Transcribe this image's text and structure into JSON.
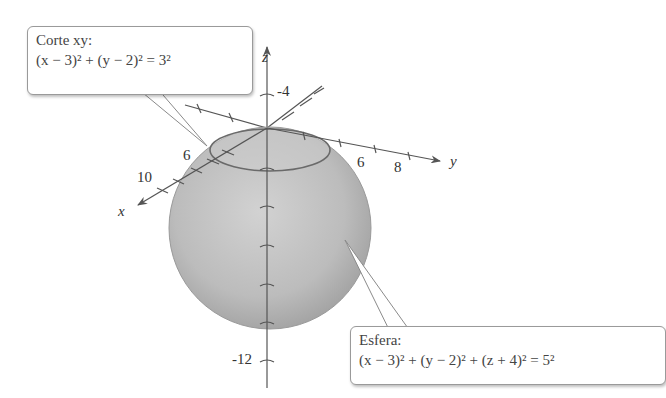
{
  "figure": {
    "type": "3d-sphere-diagram",
    "axes": {
      "x": {
        "label": "x",
        "ticks": [
          "6",
          "10"
        ]
      },
      "y": {
        "label": "y",
        "ticks": [
          "6",
          "8"
        ]
      },
      "z": {
        "label": "z",
        "ticks": [
          "-4",
          "-12"
        ]
      }
    },
    "callouts": {
      "trace": {
        "title": "Corte xy:",
        "equation": "(x − 3)² + (y − 2)² = 3²"
      },
      "sphere": {
        "title": "Esfera:",
        "equation": "(x − 3)² + (y − 2)² + (z + 4)² = 5²"
      }
    },
    "colors": {
      "sphere_fill": "#b8b8b8",
      "sphere_edge": "#8f8f8f",
      "axis": "#555555",
      "trace_ellipse": "#6a6a6a",
      "callout_border": "#9a9a9a"
    }
  }
}
